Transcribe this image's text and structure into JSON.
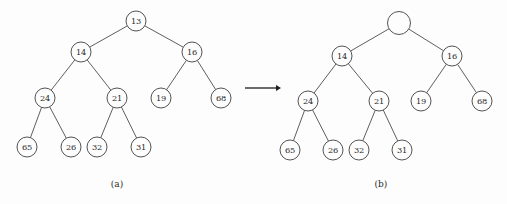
{
  "figure": {
    "background_color": "#fdfdfd",
    "stroke_color": "#4a4a4a",
    "text_color": "#2a2a2a",
    "arrow_color": "#1e1e1e"
  },
  "panels": [
    {
      "id": "panel-a",
      "caption": "(a)",
      "caption_x": 117,
      "caption_y": 184,
      "nodes": [
        {
          "id": "a-root",
          "label": "13",
          "x": 136,
          "y": 21,
          "r": 10,
          "empty": false
        },
        {
          "id": "a-l1-l",
          "label": "14",
          "x": 81,
          "y": 52,
          "r": 10,
          "empty": false
        },
        {
          "id": "a-l1-r",
          "label": "16",
          "x": 192,
          "y": 52,
          "r": 10,
          "empty": false
        },
        {
          "id": "a-l2-a",
          "label": "24",
          "x": 45,
          "y": 98,
          "r": 10,
          "empty": false
        },
        {
          "id": "a-l2-b",
          "label": "21",
          "x": 117,
          "y": 98,
          "r": 10,
          "empty": false
        },
        {
          "id": "a-l2-c",
          "label": "19",
          "x": 161,
          "y": 98,
          "r": 10,
          "empty": false
        },
        {
          "id": "a-l2-d",
          "label": "68",
          "x": 221,
          "y": 98,
          "r": 10,
          "empty": false
        },
        {
          "id": "a-l3-a",
          "label": "65",
          "x": 27,
          "y": 147,
          "r": 10,
          "empty": false
        },
        {
          "id": "a-l3-b",
          "label": "26",
          "x": 71,
          "y": 147,
          "r": 10,
          "empty": false
        },
        {
          "id": "a-l3-c",
          "label": "32",
          "x": 97,
          "y": 147,
          "r": 10,
          "empty": false
        },
        {
          "id": "a-l3-d",
          "label": "31",
          "x": 141,
          "y": 147,
          "r": 10,
          "empty": false
        }
      ],
      "edges": [
        [
          "a-root",
          "a-l1-l"
        ],
        [
          "a-root",
          "a-l1-r"
        ],
        [
          "a-l1-l",
          "a-l2-a"
        ],
        [
          "a-l1-l",
          "a-l2-b"
        ],
        [
          "a-l1-r",
          "a-l2-c"
        ],
        [
          "a-l1-r",
          "a-l2-d"
        ],
        [
          "a-l2-a",
          "a-l3-a"
        ],
        [
          "a-l2-a",
          "a-l3-b"
        ],
        [
          "a-l2-b",
          "a-l3-c"
        ],
        [
          "a-l2-b",
          "a-l3-d"
        ]
      ]
    },
    {
      "id": "panel-b",
      "caption": "(b)",
      "caption_x": 381,
      "caption_y": 184,
      "nodes": [
        {
          "id": "b-root",
          "label": "",
          "x": 399,
          "y": 23,
          "r": 11.5,
          "empty": true
        },
        {
          "id": "b-l1-l",
          "label": "14",
          "x": 342,
          "y": 56,
          "r": 10,
          "empty": false
        },
        {
          "id": "b-l1-r",
          "label": "16",
          "x": 452,
          "y": 56,
          "r": 10,
          "empty": false
        },
        {
          "id": "b-l2-a",
          "label": "24",
          "x": 308,
          "y": 101,
          "r": 10,
          "empty": false
        },
        {
          "id": "b-l2-b",
          "label": "21",
          "x": 379,
          "y": 101,
          "r": 10,
          "empty": false
        },
        {
          "id": "b-l2-c",
          "label": "19",
          "x": 421,
          "y": 101,
          "r": 10,
          "empty": false
        },
        {
          "id": "b-l2-d",
          "label": "68",
          "x": 482,
          "y": 101,
          "r": 10,
          "empty": false
        },
        {
          "id": "b-l3-a",
          "label": "65",
          "x": 290,
          "y": 150,
          "r": 10,
          "empty": false
        },
        {
          "id": "b-l3-b",
          "label": "26",
          "x": 333,
          "y": 150,
          "r": 10,
          "empty": false
        },
        {
          "id": "b-l3-c",
          "label": "32",
          "x": 359,
          "y": 150,
          "r": 10,
          "empty": false
        },
        {
          "id": "b-l3-d",
          "label": "31",
          "x": 402,
          "y": 150,
          "r": 10,
          "empty": false
        }
      ],
      "edges": [
        [
          "b-root",
          "b-l1-l"
        ],
        [
          "b-root",
          "b-l1-r"
        ],
        [
          "b-l1-l",
          "b-l2-a"
        ],
        [
          "b-l1-l",
          "b-l2-b"
        ],
        [
          "b-l1-r",
          "b-l2-c"
        ],
        [
          "b-l1-r",
          "b-l2-d"
        ],
        [
          "b-l2-a",
          "b-l3-a"
        ],
        [
          "b-l2-a",
          "b-l3-b"
        ],
        [
          "b-l2-b",
          "b-l3-c"
        ],
        [
          "b-l2-b",
          "b-l3-d"
        ]
      ]
    }
  ],
  "transition_arrow": {
    "label": "",
    "x1": 245,
    "x2": 281,
    "y": 88,
    "head_size": 5
  }
}
